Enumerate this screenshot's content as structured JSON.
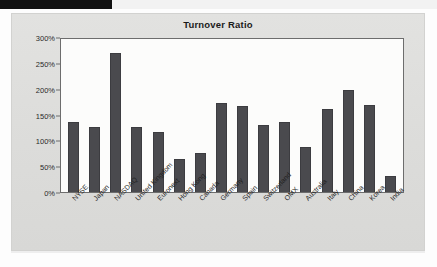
{
  "page": {
    "banner_label": "",
    "background_color": "#dedede"
  },
  "chart_data": {
    "type": "bar",
    "title": "Turnover Ratio",
    "xlabel": "",
    "ylabel": "",
    "ylim": [
      0,
      300
    ],
    "grid": false,
    "legend": "none",
    "bar_color": "#4a4a4e",
    "plot_background": "#fcfcfb",
    "ytick_labels": [
      "300%",
      "250%",
      "200%",
      "150%",
      "100%",
      "50%",
      "0%"
    ],
    "ytick_values": [
      300,
      250,
      200,
      150,
      100,
      50,
      0
    ],
    "categories": [
      "NYSE",
      "Japan",
      "NASDAQ",
      "United Kingdom",
      "Euronext",
      "Hong Kong",
      "Canada",
      "Germany",
      "Spain",
      "Switzerland",
      "OMX",
      "Australia",
      "Italy",
      "China",
      "Korea",
      "India"
    ],
    "values": [
      135,
      126,
      270,
      126,
      117,
      64,
      76,
      172,
      166,
      130,
      135,
      88,
      161,
      198,
      168,
      31
    ],
    "value_labels": [
      "135%",
      "126%",
      "270%",
      "126%",
      "117%",
      "64%",
      "76%",
      "172%",
      "166%",
      "130%",
      "135%",
      "88%",
      "161%",
      "198%",
      "168%",
      "31%"
    ]
  }
}
